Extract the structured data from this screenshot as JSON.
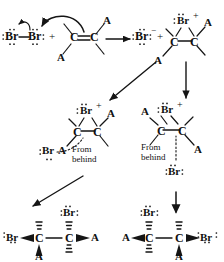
{
  "diagram": {
    "ink_color": "#151515",
    "reagents": {
      "bromine_left": "Br",
      "bromine_right": "Br",
      "plus_1": "+",
      "alkene_c1": "C",
      "alkene_c2": "C",
      "alkene_sub_top": "A",
      "alkene_sub_bottom": "A"
    },
    "products_step1": {
      "bromide_ion": "Br",
      "bromide_charge": "−",
      "plus_2": "+",
      "bromonium_br": "Br",
      "bromonium_charge": "+",
      "bromonium_c1": "C",
      "bromonium_c2": "C",
      "bromonium_sub_top": "A",
      "bromonium_sub_bottom": "A"
    },
    "intermediate_left": {
      "br": "Br",
      "charge": "+",
      "c1": "C",
      "c2": "C",
      "sub_top": "A",
      "sub_bottom": "A",
      "attacking_br": "Br",
      "note_line1": "From",
      "note_line2": "behind"
    },
    "intermediate_right": {
      "br": "Br",
      "charge": "+",
      "c1": "C",
      "c2": "C",
      "sub_top": "A",
      "sub_bottom": "A",
      "attacking_br": "Br",
      "note_line1": "From",
      "note_line2": "behind"
    },
    "product_left": {
      "br_left": "Br",
      "c1": "C",
      "c2": "C",
      "br_top": "Br",
      "sub_bottom": "A",
      "sub_right": "A"
    },
    "product_right": {
      "sub_left": "A",
      "c1": "C",
      "c2": "C",
      "br_top": "Br",
      "sub_bottom": "A",
      "br_right": "Br"
    },
    "arrows": {
      "reaction_main": "reaction-arrow-right",
      "branch_left": "arrow-down-left",
      "branch_right": "arrow-down",
      "attack_left": "arrow-down-left",
      "attack_right": "arrow-down",
      "curved_heterolysis": "curved-arrow-br-br",
      "curved_pi_attack": "curved-arrow-pi-to-br"
    }
  }
}
